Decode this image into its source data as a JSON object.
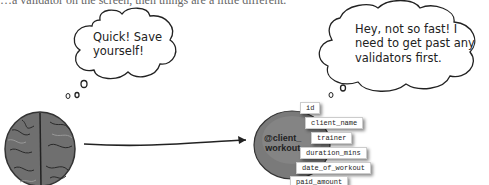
{
  "caption": {
    "partial_text": "…a validator on the screen, then things are a little different."
  },
  "bubbles": {
    "left": {
      "line1": "Quick! Save",
      "line2": "yourself!"
    },
    "right": {
      "line1": "Hey, not so fast! I",
      "line2": "need to get past any",
      "line3": "validators first."
    }
  },
  "object": {
    "label_line1": "@client_",
    "label_line2": "workout",
    "fields": [
      "id",
      "client_name",
      "trainer",
      "duration_mins",
      "date_of_workout",
      "paid_amount"
    ]
  },
  "icons": {
    "brain": "brain-illustration",
    "arrow": "arrow-right",
    "object": "object-blob"
  }
}
